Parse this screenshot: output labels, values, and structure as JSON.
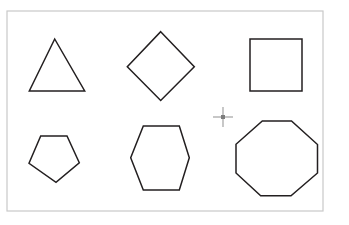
{
  "canvas": {
    "width": 349,
    "height": 225,
    "background_color": "#ffffff",
    "border_color": "#c9c9c9",
    "shape_stroke_color": "#231f20",
    "shape_fill_color": "#ffffff",
    "cursor_color": "#7d7d7d",
    "frame": {
      "x": 7,
      "y": 11,
      "width": 316,
      "height": 200
    }
  },
  "shapes": [
    {
      "name": "triangle",
      "label": "Triangle",
      "sides": 3,
      "points": "54.7,39 84.7,91 29.3,91"
    },
    {
      "name": "diamond",
      "label": "Diamond",
      "sides": 4,
      "points": "160.7,31.7 194.3,66.7 160.7,100.5 127.3,66.7"
    },
    {
      "name": "square",
      "label": "Square",
      "sides": 4,
      "points": "250,39 302,39 302,91 250,91"
    },
    {
      "name": "pentagon",
      "label": "Pentagon",
      "sides": 5,
      "points": "40.7,136 67,136 79.3,162.7 56,182.3 29,163.3"
    },
    {
      "name": "hexagon",
      "label": "Hexagon",
      "sides": 6,
      "points": "143.3,126 179.3,126 189.3,157.7 179.3,190 143.3,190 130.7,157.7"
    },
    {
      "name": "octagon",
      "label": "Octagon",
      "sides": 8,
      "points": "262.3,121 291.5,121 317.5,144.5 317.5,173 291,195.7 260.7,195.7 236,173 236,144.3"
    }
  ],
  "cursor": {
    "name": "crosshair",
    "x": 223,
    "y": 117,
    "arm_length": 10
  }
}
